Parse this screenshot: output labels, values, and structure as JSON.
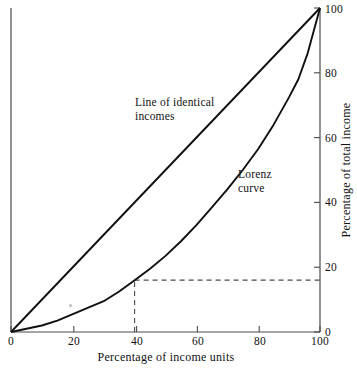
{
  "chart_data": {
    "type": "line",
    "title": "",
    "xlabel": "Percentage  of income units",
    "ylabel": "Percentage of total income",
    "xlim": [
      0,
      100
    ],
    "ylim": [
      0,
      100
    ],
    "grid": false,
    "legend_position": "inline-annotations",
    "xticks": [
      0,
      20,
      40,
      60,
      80,
      100
    ],
    "xtick_labels": [
      "0",
      "20",
      "40",
      "60",
      "80",
      "100"
    ],
    "yticks": [
      0,
      20,
      40,
      60,
      80,
      100
    ],
    "ytick_labels": [
      "0",
      "20",
      "40",
      "60",
      "80",
      "100"
    ],
    "ytick_side": "right",
    "series": [
      {
        "name": "Line of identical incomes",
        "type": "line",
        "x": [
          0,
          100
        ],
        "values": [
          0,
          100
        ]
      },
      {
        "name": "Lorenz curve",
        "type": "line",
        "x": [
          0,
          5,
          10,
          15,
          20,
          25,
          30,
          35,
          40,
          45,
          50,
          55,
          60,
          65,
          70,
          75,
          80,
          85,
          90,
          93,
          96,
          100
        ],
        "values": [
          0,
          1,
          2,
          3.5,
          5.5,
          7.5,
          9.5,
          12.5,
          16,
          19.5,
          23.5,
          28,
          33,
          38.5,
          44,
          50,
          56.5,
          64,
          72.5,
          78,
          86,
          100
        ]
      }
    ],
    "annotations": [
      {
        "name": "line-of-identical-incomes-label",
        "text": "Line of identical\nincomes",
        "x": 33,
        "y": 69
      },
      {
        "name": "lorenz-curve-label",
        "text": "Lorenz\ncurve",
        "x": 71,
        "y": 47
      }
    ],
    "reference_lines": [
      {
        "name": "guide-horizontal",
        "orientation": "horizontal",
        "value": 16,
        "from_x": 40,
        "to_x": 100,
        "style": "dashed"
      },
      {
        "name": "guide-vertical",
        "orientation": "vertical",
        "value": 40,
        "from_y": 0,
        "to_y": 16,
        "style": "dashed"
      }
    ],
    "highlighted_point": {
      "x": 40,
      "y": 16
    },
    "colors": {
      "curve": "#101010",
      "axis": "#4a4a4a",
      "guide": "#4a4a4a",
      "text": "#111111",
      "background": "#ffffff"
    }
  },
  "figure": {
    "x_axis_title": "Percentage  of income units",
    "y_axis_title": "Percentage of total income",
    "x_tick_labels": [
      "0",
      "20",
      "40",
      "60",
      "80",
      "100"
    ],
    "y_tick_labels": [
      "0",
      "20",
      "40",
      "60",
      "80",
      "100"
    ],
    "label_identical": "Line of identical\nincomes",
    "label_lorenz": "Lorenz\ncurve"
  }
}
